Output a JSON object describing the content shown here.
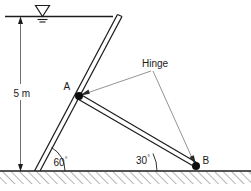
{
  "figure": {
    "labels": {
      "depth": "5 m",
      "point_a": "A",
      "point_b": "B",
      "hinge": "Hinge",
      "angle_gate": "60",
      "angle_strut": "30",
      "degree_symbol": "°"
    },
    "icons": {
      "water_table": "water-table-icon",
      "ground_hatch": "ground-hatching-icon",
      "dimension_arrow_up": "arrow-up-icon",
      "dimension_arrow_down": "arrow-down-icon",
      "leader_arrow_a": "arrow-to-hinge-a-icon",
      "leader_arrow_b": "arrow-to-hinge-b-icon"
    },
    "colors": {
      "line": "#1c1c1c",
      "leader": "#4a4a4a",
      "text": "#1a1a1a",
      "background": "#ffffff",
      "node": "#0d0d0d"
    },
    "geometry": {
      "water_surface_y": 16,
      "ground_y": 171,
      "depth_value_m": 5,
      "gate_angle_deg": 60,
      "strut_angle_deg": 30,
      "hinge_a": [
        79,
        96
      ],
      "hinge_b": [
        196,
        166
      ]
    }
  }
}
